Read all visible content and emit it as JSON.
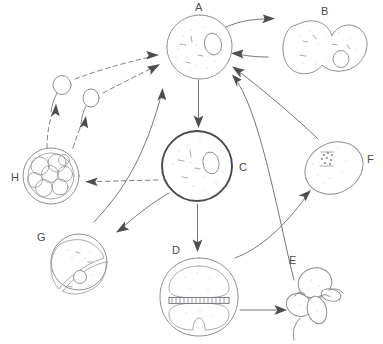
{
  "figure": {
    "style": "hand-drawn pencil sketch",
    "background_color": "#ffffff",
    "line_color": "#8e8e92",
    "bold_line_color": "#4a4a4e",
    "label_color": "#4a4a4f",
    "width": 383,
    "height": 344
  },
  "labels": {
    "a": "A",
    "b": "B",
    "c": "C",
    "d": "D",
    "e": "E",
    "f": "F",
    "g": "G",
    "h": "H"
  },
  "stages": [
    {
      "id": "a",
      "label": "A",
      "shape": "round-cell-with-nucleus",
      "label_position": "top",
      "center": [
        200,
        47
      ],
      "radius": 32,
      "nucleus": true,
      "outline": "thin"
    },
    {
      "id": "b",
      "label": "B",
      "shape": "dividing-binucleate-dumbbell",
      "label_position": "top",
      "center": [
        320,
        55
      ],
      "radius": 34,
      "nucleus": true,
      "outline": "thin"
    },
    {
      "id": "c",
      "label": "C",
      "shape": "round-cell-with-nucleus",
      "label_position": "right",
      "center": [
        197,
        166
      ],
      "radius": 35,
      "nucleus": true,
      "outline": "bold"
    },
    {
      "id": "d",
      "label": "D",
      "shape": "two-cells-with-dividing-plate",
      "label_position": "top-left",
      "center": [
        199,
        296
      ],
      "radius": 36,
      "nucleus": false,
      "outline": "thin"
    },
    {
      "id": "e",
      "label": "E",
      "shape": "flagellated-cell-cluster",
      "label_position": "top-left",
      "center": [
        310,
        300
      ],
      "radius": 24,
      "nucleus": false,
      "outline": "thin"
    },
    {
      "id": "f",
      "label": "F",
      "shape": "oval-cell-with-chromatin-cluster",
      "label_position": "right",
      "center": [
        334,
        168
      ],
      "radius": 28,
      "nucleus": true,
      "outline": "thin"
    },
    {
      "id": "g",
      "label": "G",
      "shape": "cell-split-into-two-halves",
      "label_position": "left",
      "center": [
        79,
        262
      ],
      "radius": 28,
      "nucleus": true,
      "outline": "thin"
    },
    {
      "id": "h",
      "label": "H",
      "shape": "cyst-with-eight-daughter-cells",
      "label_position": "left",
      "center": [
        51,
        176
      ],
      "radius": 28,
      "nucleus": false,
      "outline": "thin"
    }
  ],
  "swarmers": [
    {
      "id": "swarmer-1",
      "head": [
        62,
        85
      ],
      "note": "flagellated swarmer cell with tail"
    },
    {
      "id": "swarmer-2",
      "head": [
        91,
        98
      ],
      "note": "flagellated swarmer cell with tail"
    }
  ],
  "arrows": [
    {
      "id": "a-to-b",
      "from": "A",
      "to": "B",
      "style": "solid",
      "direction": "right"
    },
    {
      "id": "b-to-a",
      "from": "B",
      "to": "A",
      "style": "solid",
      "direction": "left"
    },
    {
      "id": "a-to-c",
      "from": "A",
      "to": "C",
      "style": "solid",
      "direction": "down"
    },
    {
      "id": "c-to-h",
      "from": "C",
      "to": "H",
      "style": "dashed",
      "direction": "left"
    },
    {
      "id": "c-to-g",
      "from": "C",
      "to": "G",
      "style": "solid",
      "direction": "down-left"
    },
    {
      "id": "c-to-d",
      "from": "C",
      "to": "D",
      "style": "solid",
      "direction": "down"
    },
    {
      "id": "g-to-a",
      "from": "G",
      "to": "A",
      "style": "solid",
      "direction": "up-right"
    },
    {
      "id": "d-to-e",
      "from": "D",
      "to": "E",
      "style": "solid",
      "direction": "right"
    },
    {
      "id": "e-to-f",
      "from": "E",
      "to": "F",
      "style": "solid",
      "direction": "up-right"
    },
    {
      "id": "f-to-a",
      "from": "F",
      "to": "A",
      "style": "solid",
      "direction": "up-left"
    },
    {
      "id": "e-to-a",
      "from": "E",
      "to": "A",
      "style": "solid",
      "direction": "up-left"
    },
    {
      "id": "swarmer1-to-a",
      "from": "swarmer-1",
      "to": "A",
      "style": "dashed",
      "direction": "up-right"
    },
    {
      "id": "swarmer2-to-a",
      "from": "swarmer-2",
      "to": "A",
      "style": "dashed",
      "direction": "up-right"
    },
    {
      "id": "h-to-swarmer1",
      "from": "H",
      "to": "swarmer-1",
      "style": "dashed",
      "direction": "up"
    },
    {
      "id": "h-to-swarmer2",
      "from": "H",
      "to": "swarmer-2",
      "style": "dashed",
      "direction": "up"
    }
  ]
}
